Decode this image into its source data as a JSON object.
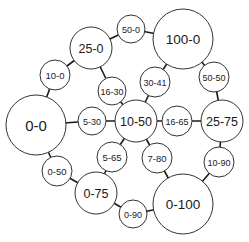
{
  "diagram": {
    "type": "graph",
    "colors": {
      "edge": "#1a1a1a",
      "node_stroke": "#333333",
      "node_fill": "#ffffff",
      "text": "#1a1a1a"
    },
    "nodes": [
      {
        "id": "n0_0",
        "label": "0-0",
        "x": 36,
        "y": 125,
        "r": 30,
        "fs": 15
      },
      {
        "id": "n10_0",
        "label": "10-0",
        "x": 55,
        "y": 75,
        "r": 15,
        "fs": 9.5
      },
      {
        "id": "n25_0",
        "label": "25-0",
        "x": 91,
        "y": 48,
        "r": 21,
        "fs": 12.5
      },
      {
        "id": "n50_0",
        "label": "50-0",
        "x": 131,
        "y": 29,
        "r": 14,
        "fs": 9
      },
      {
        "id": "n100_0",
        "label": "100-0",
        "x": 183,
        "y": 39,
        "r": 30,
        "fs": 13.5
      },
      {
        "id": "n16_30",
        "label": "16-30",
        "x": 112,
        "y": 91,
        "r": 14,
        "fs": 9
      },
      {
        "id": "n30_41",
        "label": "30-41",
        "x": 155,
        "y": 82,
        "r": 15,
        "fs": 9
      },
      {
        "id": "n50_50",
        "label": "50-50",
        "x": 214,
        "y": 77,
        "r": 15,
        "fs": 9
      },
      {
        "id": "n5_30",
        "label": "5-30",
        "x": 92,
        "y": 121,
        "r": 14,
        "fs": 9
      },
      {
        "id": "n10_50",
        "label": "10-50",
        "x": 136,
        "y": 121,
        "r": 21,
        "fs": 12.5
      },
      {
        "id": "n16_65",
        "label": "16-65",
        "x": 177,
        "y": 121,
        "r": 15,
        "fs": 9
      },
      {
        "id": "n25_75",
        "label": "25-75",
        "x": 222,
        "y": 121,
        "r": 21,
        "fs": 12.5
      },
      {
        "id": "n0_50",
        "label": "0-50",
        "x": 57,
        "y": 171,
        "r": 15,
        "fs": 9.5
      },
      {
        "id": "n5_65",
        "label": "5-65",
        "x": 112,
        "y": 157,
        "r": 15,
        "fs": 9.5
      },
      {
        "id": "n7_80",
        "label": "7-80",
        "x": 157,
        "y": 158,
        "r": 15,
        "fs": 9.5
      },
      {
        "id": "n10_90",
        "label": "10-90",
        "x": 219,
        "y": 162,
        "r": 15,
        "fs": 9
      },
      {
        "id": "n0_75",
        "label": "0-75",
        "x": 96,
        "y": 193,
        "r": 21,
        "fs": 12.5
      },
      {
        "id": "n0_90",
        "label": "0-90",
        "x": 133,
        "y": 214,
        "r": 14,
        "fs": 9
      },
      {
        "id": "n0_100",
        "label": "0-100",
        "x": 183,
        "y": 204,
        "r": 30,
        "fs": 13.5
      }
    ],
    "edges": [
      [
        "n0_0",
        "n10_0"
      ],
      [
        "n10_0",
        "n25_0"
      ],
      [
        "n25_0",
        "n50_0"
      ],
      [
        "n50_0",
        "n100_0"
      ],
      [
        "n25_0",
        "n16_30"
      ],
      [
        "n16_30",
        "n10_50"
      ],
      [
        "n0_0",
        "n5_30"
      ],
      [
        "n5_30",
        "n10_50"
      ],
      [
        "n10_50",
        "n30_41"
      ],
      [
        "n30_41",
        "n100_0"
      ],
      [
        "n100_0",
        "n50_50"
      ],
      [
        "n50_50",
        "n25_75"
      ],
      [
        "n10_50",
        "n16_65"
      ],
      [
        "n16_65",
        "n25_75"
      ],
      [
        "n25_75",
        "n10_90"
      ],
      [
        "n10_90",
        "n0_100"
      ],
      [
        "n10_50",
        "n5_65"
      ],
      [
        "n5_65",
        "n0_75"
      ],
      [
        "n10_50",
        "n7_80"
      ],
      [
        "n7_80",
        "n0_100"
      ],
      [
        "n0_0",
        "n0_50"
      ],
      [
        "n0_50",
        "n0_75"
      ],
      [
        "n0_75",
        "n0_90"
      ],
      [
        "n0_90",
        "n0_100"
      ]
    ]
  }
}
